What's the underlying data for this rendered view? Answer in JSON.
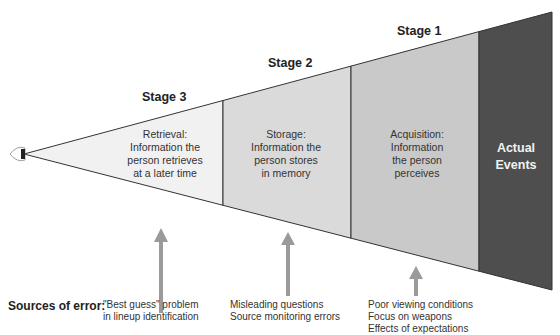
{
  "colors": {
    "stage3_fill": "#f1f1f1",
    "stage2_fill": "#dadada",
    "stage1_fill": "#c9c9c9",
    "events_fill": "#4e4e4e",
    "arrow": "#9a9a9a",
    "outline": "#333333"
  },
  "stages": [
    {
      "title": "Stage 3",
      "line1": "Retrieval:",
      "line2": "Information the",
      "line3": "person retrieves",
      "line4": "at a later time"
    },
    {
      "title": "Stage 2",
      "line1": "Storage:",
      "line2": "Information the",
      "line3": "person stores",
      "line4": "in memory"
    },
    {
      "title": "Stage 1",
      "line1": "Acquisition:",
      "line2": "Information",
      "line3": "the person",
      "line4": "perceives"
    }
  ],
  "actual_events": {
    "line1": "Actual",
    "line2": "Events"
  },
  "eye_icon": "eye-icon",
  "sources": {
    "title": "Sources of error:",
    "stage3": [
      "\"Best guess\" problem",
      "in lineup identification"
    ],
    "stage2": [
      "Misleading questions",
      "Source monitoring errors"
    ],
    "stage1": [
      "Poor viewing conditions",
      "Focus on weapons",
      "Effects of expectations"
    ]
  }
}
